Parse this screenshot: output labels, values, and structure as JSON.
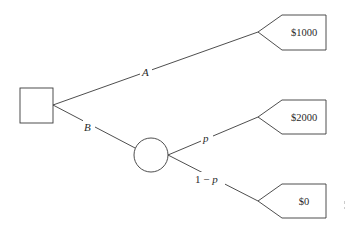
{
  "diagram": {
    "type": "decision-tree",
    "decision_node": {
      "shape": "square"
    },
    "chance_node": {
      "shape": "circle"
    },
    "branches": {
      "A": {
        "label": "A",
        "payoff": "$1000"
      },
      "B": {
        "label": "B"
      },
      "p": {
        "label": "p",
        "payoff": "$2000"
      },
      "one_minus_p": {
        "label_prefix": "1 − ",
        "label_var": "p",
        "payoff": "$0"
      }
    }
  },
  "colors": {
    "stroke": "#3a3a3a",
    "text": "#2a2a2a",
    "background": "#ffffff"
  }
}
